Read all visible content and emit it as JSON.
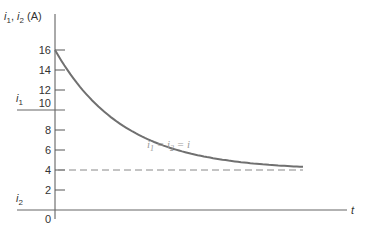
{
  "chart_data": {
    "type": "line",
    "title": "",
    "ylabel": "i1, i2 (A)",
    "ylabel_parts": {
      "i1": "i",
      "sub1": "1",
      "sep": ", ",
      "i2": "i",
      "sub2": "2",
      "unit": " (A)"
    },
    "xlabel": "t",
    "ylim": [
      0,
      16
    ],
    "yticks": [
      0,
      2,
      4,
      6,
      8,
      10,
      12,
      14,
      16
    ],
    "ytick_labels": [
      "0",
      "2",
      "4",
      "6",
      "8",
      "10",
      "12",
      "14",
      "16"
    ],
    "grid": false,
    "series": [
      {
        "name": "i1 = i2 = i",
        "description": "exponential decay from 16 A toward 4 A",
        "style": "solid",
        "initial": 16,
        "final": 4,
        "x_normalized": [
          0,
          0.05,
          0.1,
          0.15,
          0.2,
          0.25,
          0.3,
          0.35,
          0.4,
          0.45,
          0.5,
          0.55,
          0.6,
          0.65,
          0.7,
          0.75,
          0.8
        ],
        "values": [
          16,
          14.2,
          12.6,
          11.2,
          9.9,
          8.8,
          7.8,
          6.9,
          6.2,
          5.6,
          5.1,
          4.7,
          4.5,
          4.3,
          4.15,
          4.05,
          4.0
        ]
      },
      {
        "name": "asymptote",
        "style": "dashed",
        "value": 4
      },
      {
        "name": "i1 (pre-switch)",
        "style": "solid",
        "value": 10,
        "label": "i",
        "label_sub": "1"
      },
      {
        "name": "i2 (pre-switch)",
        "style": "solid",
        "value": 0,
        "label": "i",
        "label_sub": "2"
      }
    ],
    "annotations": [
      {
        "text_parts": [
          "i",
          "1",
          " = ",
          "i",
          "2",
          " = ",
          "i"
        ],
        "plain": "i1 = i2 = i"
      }
    ]
  }
}
